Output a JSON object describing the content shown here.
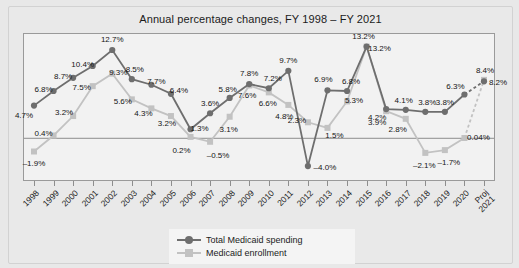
{
  "chart_data": {
    "type": "line",
    "title": "Annual percentage changes, FY 1998 – FY 2021",
    "xlabel": "",
    "ylabel": "",
    "ylim": [
      -6.0,
      15.0
    ],
    "grid": false,
    "legend_position": "bottom-center",
    "zero_line": true,
    "categories": [
      "1998",
      "1999",
      "2000",
      "2001",
      "2002",
      "2003",
      "2004",
      "2005",
      "2006",
      "2007",
      "2008",
      "2009",
      "2010",
      "2011",
      "2012",
      "2013",
      "2014",
      "2015",
      "2016",
      "2017",
      "2018",
      "2019",
      "2020",
      "Proj\n2021"
    ],
    "series": [
      {
        "name": "Total Medicaid spending",
        "color": "#6e6e6e",
        "marker": "circle",
        "values": [
          4.7,
          6.8,
          8.7,
          10.4,
          12.7,
          8.5,
          7.7,
          6.4,
          1.3,
          3.6,
          5.8,
          7.8,
          7.2,
          9.7,
          -4.0,
          6.9,
          6.8,
          13.2,
          4.2,
          4.1,
          3.8,
          3.8,
          6.3,
          8.2
        ],
        "labels": [
          "4.7%",
          "6.8%",
          "8.7%",
          "10.4%",
          "12.7%",
          "8.5%",
          "7.7%",
          "6.4%",
          "1.3%",
          "3.6%",
          "5.8%",
          "7.8%",
          "7.2%",
          "9.7%",
          "–4.0%",
          "6.9%",
          "6.8%",
          "13.2%",
          "4.2%",
          "4.1%",
          "3.8%",
          "3.8%",
          "6.3%",
          "8.2%"
        ],
        "projected_last": true
      },
      {
        "name": "Medicaid enrollment",
        "color": "#c2c2c2",
        "marker": "square",
        "values": [
          -1.9,
          0.4,
          3.2,
          7.5,
          9.3,
          5.6,
          4.3,
          3.2,
          0.2,
          -0.5,
          3.1,
          7.6,
          6.6,
          4.8,
          2.3,
          1.5,
          5.3,
          13.2,
          3.9,
          2.8,
          -2.1,
          -1.7,
          0.04,
          8.4
        ],
        "labels": [
          "–1.9%",
          "0.4%",
          "3.2%",
          "7.5%",
          "9.3%",
          "5.6%",
          "4.3%",
          "3.2%",
          "0.2%",
          "–0.5%",
          "3.1%",
          "7.6%",
          "6.6%",
          "4.8%",
          "2.3%",
          "1.5%",
          "5.3%",
          "13.2%",
          "3.9%",
          "2.8%",
          "–2.1%",
          "–1.7%",
          "0.04%",
          "8.4%"
        ],
        "projected_last": true
      }
    ]
  },
  "legend": {
    "items": [
      {
        "label": "Total Medicaid spending",
        "marker": "circle-marker",
        "color": "#6e6e6e"
      },
      {
        "label": "Medicaid enrollment",
        "marker": "square-marker",
        "color": "#c2c2c2"
      }
    ]
  },
  "colors": {
    "spending": "#6e6e6e",
    "enrollment": "#c2c2c2",
    "plot_background": "#f2f2f2",
    "figure_background": "#e9e9e9",
    "axis": "#8d8d8d",
    "text": "#1b1b1b"
  },
  "label_offsets": {
    "spending": [
      {
        "dx": -10,
        "dy": 9
      },
      {
        "dx": -10,
        "dy": -2
      },
      {
        "dx": -10,
        "dy": -2
      },
      {
        "dx": -10,
        "dy": -2
      },
      {
        "dx": 0,
        "dy": -11
      },
      {
        "dx": 3,
        "dy": -10
      },
      {
        "dx": 5,
        "dy": -4
      },
      {
        "dx": 8,
        "dy": -4
      },
      {
        "dx": 9,
        "dy": -1
      },
      {
        "dx": 0,
        "dy": -10
      },
      {
        "dx": -2,
        "dy": -9
      },
      {
        "dx": 0,
        "dy": -11
      },
      {
        "dx": 4,
        "dy": -10
      },
      {
        "dx": 0,
        "dy": -11
      },
      {
        "dx": 17,
        "dy": 1
      },
      {
        "dx": -4,
        "dy": -11
      },
      {
        "dx": 4,
        "dy": -10
      },
      {
        "dx": -3,
        "dy": -11
      },
      {
        "dx": -9,
        "dy": 8
      },
      {
        "dx": -2,
        "dy": -10
      },
      {
        "dx": 2,
        "dy": -10
      },
      {
        "dx": 0,
        "dy": -10
      },
      {
        "dx": -9,
        "dy": -8
      },
      {
        "dx": 14,
        "dy": 1
      }
    ],
    "enrollment": [
      {
        "dx": 0,
        "dy": 12
      },
      {
        "dx": -10,
        "dy": -3
      },
      {
        "dx": -9,
        "dy": -4
      },
      {
        "dx": -11,
        "dy": 1
      },
      {
        "dx": 6,
        "dy": -2
      },
      {
        "dx": -9,
        "dy": 2
      },
      {
        "dx": -8,
        "dy": 5
      },
      {
        "dx": -4,
        "dy": 7
      },
      {
        "dx": -9,
        "dy": 13
      },
      {
        "dx": 8,
        "dy": 13
      },
      {
        "dx": -1,
        "dy": 12
      },
      {
        "dx": -2,
        "dy": 10
      },
      {
        "dx": -1,
        "dy": 11
      },
      {
        "dx": -4,
        "dy": 11
      },
      {
        "dx": -11,
        "dy": -2
      },
      {
        "dx": 7,
        "dy": 7
      },
      {
        "dx": 7,
        "dy": -1
      },
      {
        "dx": 13,
        "dy": 1
      },
      {
        "dx": -9,
        "dy": 11
      },
      {
        "dx": -8,
        "dy": 10
      },
      {
        "dx": -1,
        "dy": 12
      },
      {
        "dx": 4,
        "dy": 12
      },
      {
        "dx": 14,
        "dy": -1
      },
      {
        "dx": 1,
        "dy": -10
      }
    ]
  }
}
